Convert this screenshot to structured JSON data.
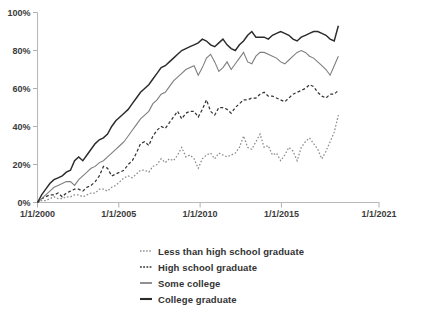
{
  "chart_data": {
    "type": "line",
    "title": "",
    "subtitle": "",
    "xlabel": "",
    "ylabel": "",
    "grid": false,
    "legend_position": "bottom-center",
    "xlim": [
      "1/1/2000",
      "1/1/2021"
    ],
    "ylim": [
      0,
      100
    ],
    "y_tick_labels": [
      "0%",
      "20%",
      "40%",
      "60%",
      "80%",
      "100%"
    ],
    "y_tick_values": [
      0,
      20,
      40,
      60,
      80,
      100
    ],
    "x_tick_labels": [
      "1/1/2000",
      "1/1/2005",
      "1/1/2010",
      "1/1/2015",
      "1/1/2021"
    ],
    "x_tick_values": [
      2000,
      2005,
      2010,
      2015,
      2021
    ],
    "x_data_start": 2000.0,
    "x_data_end": 2018.5,
    "series": [
      {
        "name": "Less than high school graduate",
        "style": "dotted",
        "color": "#8c8c8c",
        "values": [
          0,
          1,
          1,
          2,
          3,
          2,
          2,
          3,
          3,
          4,
          4,
          3,
          4,
          5,
          5,
          7,
          7,
          6,
          8,
          9,
          11,
          13,
          14,
          13,
          15,
          17,
          17,
          16,
          19,
          20,
          23,
          21,
          23,
          22,
          25,
          29,
          24,
          25,
          23,
          18,
          23,
          25,
          26,
          23,
          26,
          25,
          24,
          25,
          26,
          29,
          35,
          29,
          28,
          32,
          36,
          29,
          30,
          25,
          26,
          22,
          25,
          29,
          27,
          22,
          29,
          32,
          34,
          31,
          28,
          23,
          27,
          32,
          37,
          46
        ]
      },
      {
        "name": "High school graduate",
        "style": "dashed",
        "color": "#353535",
        "values": [
          0,
          2,
          3,
          4,
          4,
          5,
          3,
          5,
          6,
          7,
          7,
          6,
          8,
          9,
          11,
          14,
          19,
          18,
          14,
          15,
          16,
          17,
          20,
          22,
          26,
          31,
          32,
          30,
          35,
          38,
          40,
          39,
          42,
          45,
          48,
          44,
          47,
          48,
          48,
          45,
          49,
          54,
          48,
          46,
          50,
          50,
          49,
          47,
          50,
          52,
          54,
          54,
          55,
          55,
          57,
          58,
          56,
          56,
          55,
          54,
          53,
          55,
          57,
          58,
          59,
          60,
          62,
          61,
          58,
          56,
          55,
          57,
          57,
          59
        ]
      },
      {
        "name": "Some college",
        "style": "solid",
        "color": "#7e7e7e",
        "values": [
          0,
          2,
          4,
          6,
          8,
          9,
          10,
          11,
          11,
          9,
          12,
          14,
          16,
          18,
          19,
          21,
          22,
          24,
          26,
          28,
          30,
          32,
          35,
          38,
          41,
          44,
          46,
          48,
          52,
          54,
          57,
          58,
          61,
          64,
          66,
          68,
          70,
          71,
          72,
          67,
          71,
          76,
          78,
          74,
          69,
          71,
          74,
          70,
          73,
          76,
          79,
          74,
          73,
          77,
          79,
          79,
          78,
          77,
          76,
          74,
          73,
          75,
          77,
          79,
          80,
          79,
          77,
          76,
          74,
          72,
          70,
          67,
          72,
          77
        ]
      },
      {
        "name": "College graduate",
        "style": "solid",
        "color": "#2b2b2b",
        "values": [
          0,
          4,
          7,
          10,
          12,
          13,
          14,
          16,
          17,
          22,
          24,
          22,
          25,
          28,
          31,
          33,
          34,
          36,
          40,
          43,
          45,
          47,
          49,
          52,
          55,
          58,
          60,
          62,
          65,
          68,
          71,
          72,
          74,
          76,
          78,
          80,
          81,
          82,
          83,
          84,
          86,
          85,
          83,
          82,
          84,
          86,
          83,
          81,
          80,
          83,
          85,
          88,
          90,
          87,
          87,
          87,
          86,
          88,
          89,
          90,
          89,
          88,
          86,
          85,
          87,
          88,
          89,
          90,
          90,
          89,
          88,
          86,
          85,
          93
        ]
      }
    ]
  },
  "legend": {
    "items": [
      {
        "label": "Less than high school graduate",
        "marker": "dotted-line-marker"
      },
      {
        "label": "High school graduate",
        "marker": "dashed-line-marker"
      },
      {
        "label": "Some college",
        "marker": "solid-gray-line-marker"
      },
      {
        "label": "College graduate",
        "marker": "solid-dark-line-marker"
      }
    ]
  }
}
